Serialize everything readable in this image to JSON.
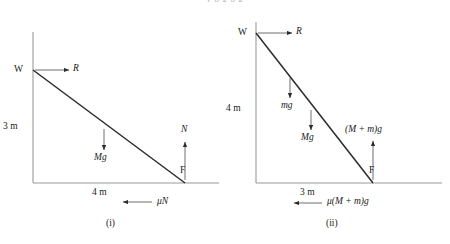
{
  "figure": {
    "caption_i": "(i)",
    "caption_ii": "(ii)",
    "stroke_color": "#2b2b2b",
    "axis_color": "#8a8a8a",
    "background": "#ffffff",
    "cut_text": "y p g p g"
  },
  "diagram_i": {
    "name": "(i)",
    "top_label": "W",
    "foot_label": "F",
    "reaction_label": "R",
    "weight_label": "Mg",
    "normal_label": "N",
    "friction_label": "μN",
    "height_label": "3 m",
    "base_label": "4 m",
    "height_value": 3,
    "base_value": 4,
    "units": "m"
  },
  "diagram_ii": {
    "name": "(ii)",
    "top_label": "W",
    "foot_label": "F",
    "reaction_label": "R",
    "ladder_weight_label": "mg",
    "person_weight_label": "Mg",
    "normal_label": "(M + m)g",
    "friction_label": "μ(M + m)g",
    "height_label": "4 m",
    "base_label": "3 m",
    "height_value": 4,
    "base_value": 3,
    "units": "m"
  }
}
